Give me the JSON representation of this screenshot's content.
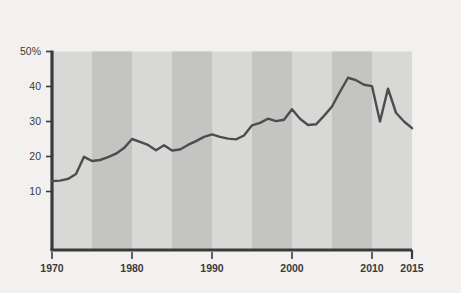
{
  "chart_data": {
    "type": "line",
    "title": "",
    "subtitle": "",
    "xlabel": "",
    "ylabel": "",
    "xlim": [
      1970,
      2015
    ],
    "ylim": [
      0,
      50
    ],
    "grid": false,
    "legend": null,
    "series_color": "#4d4d4d",
    "background_color": "#f2f1ef",
    "plot_band_light": "#d8d8d6",
    "plot_band_dark": "#c4c4c2",
    "axis_color": "#3b3b3b",
    "y_ticks": [
      "50%",
      "40",
      "30",
      "20",
      "10"
    ],
    "y_tick_values": [
      50,
      40,
      30,
      20,
      10
    ],
    "x_ticks": [
      "1970",
      "1980",
      "1990",
      "2000",
      "2010",
      "2015"
    ],
    "x_tick_values": [
      1970,
      1980,
      1990,
      2000,
      2010,
      2015
    ],
    "shaded_band_years": [
      [
        1975,
        1980
      ],
      [
        1985,
        1990
      ],
      [
        1995,
        2000
      ],
      [
        2005,
        2010
      ]
    ],
    "x": [
      1970,
      1971,
      1972,
      1973,
      1974,
      1975,
      1976,
      1977,
      1978,
      1979,
      1980,
      1981,
      1982,
      1983,
      1984,
      1985,
      1986,
      1987,
      1988,
      1989,
      1990,
      1991,
      1992,
      1993,
      1994,
      1995,
      1996,
      1997,
      1998,
      1999,
      2000,
      2001,
      2002,
      2003,
      2004,
      2005,
      2006,
      2007,
      2008,
      2009,
      2010,
      2011,
      2012,
      2013,
      2014,
      2015
    ],
    "values": [
      13.0,
      13.1,
      13.6,
      15.0,
      19.9,
      18.7,
      19.0,
      19.8,
      20.8,
      22.4,
      25.0,
      24.2,
      23.3,
      21.8,
      23.2,
      21.7,
      22.0,
      23.3,
      24.4,
      25.6,
      26.3,
      25.6,
      25.1,
      24.9,
      26.0,
      28.9,
      29.6,
      30.8,
      30.1,
      30.5,
      33.5,
      30.8,
      29.0,
      29.2,
      31.6,
      34.3,
      38.5,
      42.5,
      41.8,
      40.5,
      40.1,
      30.0,
      39.4,
      32.5,
      30.0,
      28.1
    ],
    "series": [
      {
        "name": "value",
        "values": [
          13.0,
          13.1,
          13.6,
          15.0,
          19.9,
          18.7,
          19.0,
          19.8,
          20.8,
          22.4,
          25.0,
          24.2,
          23.3,
          21.8,
          23.2,
          21.7,
          22.0,
          23.3,
          24.4,
          25.6,
          26.3,
          25.6,
          25.1,
          24.9,
          26.0,
          28.9,
          29.6,
          30.8,
          30.1,
          30.5,
          33.5,
          30.8,
          29.0,
          29.2,
          31.6,
          34.3,
          38.5,
          42.5,
          41.8,
          40.5,
          40.1,
          30.0,
          39.4,
          32.5,
          30.0,
          28.1
        ]
      }
    ]
  },
  "watermark": {
    "right_text": "ploton",
    "top_text": ""
  }
}
